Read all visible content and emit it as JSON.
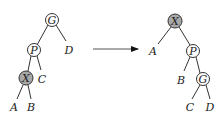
{
  "colors": {
    "node_fill": "#ffffff",
    "highlight_fill": "#a8a8a8",
    "stroke": "#333333"
  },
  "diagram": {
    "type": "tree-rotation",
    "before": {
      "nodes": [
        {
          "id": "G",
          "label": "G",
          "highlight": false
        },
        {
          "id": "P",
          "label": "P",
          "highlight": false
        },
        {
          "id": "X",
          "label": "X",
          "highlight": true
        }
      ],
      "subtrees": [
        {
          "id": "D",
          "label": "D"
        },
        {
          "id": "C",
          "label": "C"
        },
        {
          "id": "A",
          "label": "A"
        },
        {
          "id": "B",
          "label": "B"
        }
      ],
      "edges": [
        [
          "G",
          "P"
        ],
        [
          "G",
          "D"
        ],
        [
          "P",
          "X"
        ],
        [
          "P",
          "C"
        ],
        [
          "X",
          "A"
        ],
        [
          "X",
          "B"
        ]
      ]
    },
    "after": {
      "nodes": [
        {
          "id": "X",
          "label": "X",
          "highlight": true
        },
        {
          "id": "P",
          "label": "P",
          "highlight": false
        },
        {
          "id": "G",
          "label": "G",
          "highlight": false
        }
      ],
      "subtrees": [
        {
          "id": "A",
          "label": "A"
        },
        {
          "id": "B",
          "label": "B"
        },
        {
          "id": "C",
          "label": "C"
        },
        {
          "id": "D",
          "label": "D"
        }
      ],
      "edges": [
        [
          "X",
          "A"
        ],
        [
          "X",
          "P"
        ],
        [
          "P",
          "B"
        ],
        [
          "P",
          "G"
        ],
        [
          "G",
          "C"
        ],
        [
          "G",
          "D"
        ]
      ]
    }
  },
  "labels": {
    "l_G": "G",
    "l_P": "P",
    "l_X": "X",
    "l_D": "D",
    "l_C": "C",
    "l_A": "A",
    "l_B": "B",
    "r_X": "X",
    "r_A": "A",
    "r_P": "P",
    "r_B": "B",
    "r_G": "G",
    "r_C": "C",
    "r_D": "D"
  }
}
